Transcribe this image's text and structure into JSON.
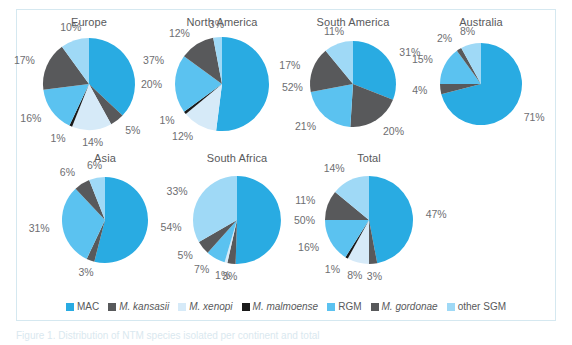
{
  "figure": {
    "background": "#ffffff",
    "border_color": "#d5e8f0"
  },
  "caption": {
    "text": "Figure 1. Distribution of NTM species isolated per continent and total"
  },
  "palette": {
    "MAC": "#29ABE2",
    "M. kansasii": "#58595B",
    "M. xenopi": "#D6EAF8",
    "M. malmoense": "#1A1A1A",
    "RGM": "#5BC2F0",
    "M. gordonae": "#58595B",
    "other SGM": "#9FD9F6"
  },
  "legend": {
    "position": "bottom",
    "items": [
      {
        "label": "MAC",
        "color": "#29ABE2",
        "italic": false
      },
      {
        "label": "M. kansasii",
        "color": "#58595B",
        "italic": true
      },
      {
        "label": "M. xenopi",
        "color": "#D6EAF8",
        "italic": true
      },
      {
        "label": "M. malmoense",
        "color": "#1A1A1A",
        "italic": true
      },
      {
        "label": "RGM",
        "color": "#5BC2F0",
        "italic": false
      },
      {
        "label": "M. gordonae",
        "color": "#58595B",
        "italic": true
      },
      {
        "label": "other SGM",
        "color": "#9FD9F6",
        "italic": false
      }
    ]
  },
  "chart_data": {
    "type": "pie",
    "title": "",
    "xlabel": "",
    "ylabel": "",
    "categories": [
      "MAC",
      "M. kansasii",
      "M. xenopi",
      "M. malmoense",
      "RGM",
      "M. gordonae",
      "other SGM"
    ],
    "units": "%",
    "legend_position": "bottom",
    "grid": false,
    "charts": [
      {
        "title": "Europe",
        "radius": 46,
        "slices": [
          {
            "name": "MAC",
            "value": 37,
            "label": "37%"
          },
          {
            "name": "M. kansasii",
            "value": 5,
            "label": "5%"
          },
          {
            "name": "M. xenopi",
            "value": 14,
            "label": "14%"
          },
          {
            "name": "M. malmoense",
            "value": 1,
            "label": "1%"
          },
          {
            "name": "RGM",
            "value": 16,
            "label": "16%"
          },
          {
            "name": "M. gordonae",
            "value": 17,
            "label": "17%"
          },
          {
            "name": "other SGM",
            "value": 10,
            "label": "10%"
          }
        ]
      },
      {
        "title": "North America",
        "radius": 47,
        "slices": [
          {
            "name": "MAC",
            "value": 52,
            "label": "52%"
          },
          {
            "name": "M. kansasii",
            "value": 0,
            "label": ""
          },
          {
            "name": "M. xenopi",
            "value": 12,
            "label": "12%"
          },
          {
            "name": "M. malmoense",
            "value": 1,
            "label": "1%"
          },
          {
            "name": "RGM",
            "value": 20,
            "label": "20%"
          },
          {
            "name": "M. gordonae",
            "value": 12,
            "label": "12%"
          },
          {
            "name": "other SGM",
            "value": 3,
            "label": "3%"
          }
        ]
      },
      {
        "title": "South America",
        "radius": 43,
        "slices": [
          {
            "name": "MAC",
            "value": 31,
            "label": "31%"
          },
          {
            "name": "M. kansasii",
            "value": 20,
            "label": "20%"
          },
          {
            "name": "M. xenopi",
            "value": 0,
            "label": ""
          },
          {
            "name": "M. malmoense",
            "value": 0,
            "label": ""
          },
          {
            "name": "RGM",
            "value": 21,
            "label": "21%"
          },
          {
            "name": "M. gordonae",
            "value": 17,
            "label": "17%"
          },
          {
            "name": "other SGM",
            "value": 11,
            "label": "11%"
          }
        ]
      },
      {
        "title": "Australia",
        "radius": 41,
        "slices": [
          {
            "name": "MAC",
            "value": 71,
            "label": "71%"
          },
          {
            "name": "M. kansasii",
            "value": 4,
            "label": "4%"
          },
          {
            "name": "M. xenopi",
            "value": 0,
            "label": ""
          },
          {
            "name": "M. malmoense",
            "value": 0,
            "label": ""
          },
          {
            "name": "RGM",
            "value": 15,
            "label": "15%"
          },
          {
            "name": "M. gordonae",
            "value": 2,
            "label": "2%"
          },
          {
            "name": "other SGM",
            "value": 8,
            "label": "8%"
          }
        ]
      },
      {
        "title": "Asia",
        "radius": 43,
        "slices": [
          {
            "name": "MAC",
            "value": 54,
            "label": "54%"
          },
          {
            "name": "M. kansasii",
            "value": 3,
            "label": "3%"
          },
          {
            "name": "M. xenopi",
            "value": 0,
            "label": ""
          },
          {
            "name": "M. malmoense",
            "value": 0,
            "label": ""
          },
          {
            "name": "RGM",
            "value": 31,
            "label": "31%"
          },
          {
            "name": "M. gordonae",
            "value": 6,
            "label": "6%"
          },
          {
            "name": "other SGM",
            "value": 6,
            "label": "6%"
          }
        ]
      },
      {
        "title": "South Africa",
        "radius": 44,
        "slices": [
          {
            "name": "MAC",
            "value": 50,
            "label": "50%"
          },
          {
            "name": "M. kansasii",
            "value": 3,
            "label": "3%"
          },
          {
            "name": "M. xenopi",
            "value": 1,
            "label": "1%"
          },
          {
            "name": "M. malmoense",
            "value": 0,
            "label": ""
          },
          {
            "name": "RGM",
            "value": 7,
            "label": "7%"
          },
          {
            "name": "M. gordonae",
            "value": 5,
            "label": "5%"
          },
          {
            "name": "other SGM",
            "value": 33,
            "label": "33%"
          }
        ]
      },
      {
        "title": "Total",
        "radius": 44,
        "slices": [
          {
            "name": "MAC",
            "value": 47,
            "label": "47%"
          },
          {
            "name": "M. kansasii",
            "value": 3,
            "label": "3%"
          },
          {
            "name": "M. xenopi",
            "value": 8,
            "label": "8%"
          },
          {
            "name": "M. malmoense",
            "value": 1,
            "label": "1%"
          },
          {
            "name": "RGM",
            "value": 16,
            "label": "16%"
          },
          {
            "name": "M. gordonae",
            "value": 11,
            "label": "11%"
          },
          {
            "name": "other SGM",
            "value": 14,
            "label": "14%"
          }
        ]
      }
    ]
  },
  "layout": {
    "positions": [
      {
        "left": 6,
        "top": 6,
        "width": 132
      },
      {
        "left": 139,
        "top": 6,
        "width": 132
      },
      {
        "left": 270,
        "top": 6,
        "width": 132
      },
      {
        "left": 398,
        "top": 6,
        "width": 132
      },
      {
        "left": 22,
        "top": 142,
        "width": 132
      },
      {
        "left": 154,
        "top": 142,
        "width": 132
      },
      {
        "left": 286,
        "top": 142,
        "width": 132
      }
    ]
  }
}
